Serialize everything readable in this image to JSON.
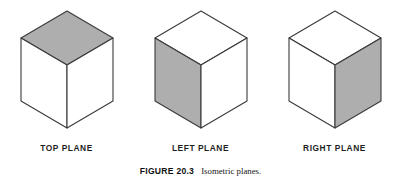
{
  "figure": {
    "caption_prefix": "FIGURE 20.3",
    "caption_text": "Isometric planes.",
    "background_color": "#FFFFFF",
    "line_color": "#3A3A3A",
    "shaded_face_color": "#AEAEAE",
    "unshaded_face_color": "#FFFFFF"
  },
  "cubes": [
    {
      "label": "TOP PLANE",
      "shaded_face": "top",
      "faces": {
        "top": {
          "fill": "#AEAEAE",
          "shaded": true
        },
        "left": {
          "fill": "#FFFFFF",
          "shaded": false
        },
        "right": {
          "fill": "#FFFFFF",
          "shaded": false
        }
      }
    },
    {
      "label": "LEFT PLANE",
      "shaded_face": "left",
      "faces": {
        "top": {
          "fill": "#FFFFFF",
          "shaded": false
        },
        "left": {
          "fill": "#AEAEAE",
          "shaded": true
        },
        "right": {
          "fill": "#FFFFFF",
          "shaded": false
        }
      }
    },
    {
      "label": "RIGHT PLANE",
      "shaded_face": "right",
      "faces": {
        "top": {
          "fill": "#FFFFFF",
          "shaded": false
        },
        "left": {
          "fill": "#FFFFFF",
          "shaded": false
        },
        "right": {
          "fill": "#AEAEAE",
          "shaded": true
        }
      }
    }
  ]
}
